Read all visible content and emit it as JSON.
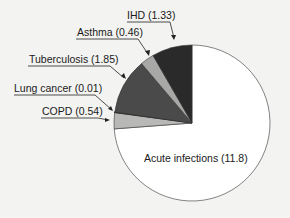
{
  "chart_data": {
    "type": "pie",
    "title": "",
    "slices": [
      {
        "label": "Acute infections",
        "value": 11.8,
        "color": "#ffffff"
      },
      {
        "label": "COPD",
        "value": 0.54,
        "color": "#b8b8b6"
      },
      {
        "label": "Lung cancer",
        "value": 0.01,
        "color": "#111111"
      },
      {
        "label": "Tuberculosis",
        "value": 1.85,
        "color": "#4a4a4a"
      },
      {
        "label": "Asthma",
        "value": 0.46,
        "color": "#a8a8a6"
      },
      {
        "label": "IHD",
        "value": 1.33,
        "color": "#2a2a2a"
      }
    ],
    "labels": {
      "acute": "Acute infections (11.8)",
      "copd": "COPD (0.54)",
      "lung": "Lung cancer (0.01)",
      "tb": "Tuberculosis (1.85)",
      "asthma": "Asthma (0.46)",
      "ihd": "IHD (1.33)"
    },
    "legend": "none",
    "start_angle": "12 o'clock, clockwise"
  }
}
